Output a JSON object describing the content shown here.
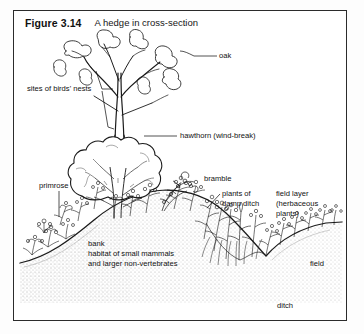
{
  "figure": {
    "number": "Figure 3.14",
    "caption": "A hedge in cross-section"
  },
  "colors": {
    "frame": "#2b2b2b",
    "ink": "#111111",
    "background": "#ffffff",
    "stipple": "#9a9a9a"
  },
  "labels": {
    "oak": "oak",
    "birds_nests": "sites of birds' nests",
    "hawthorn": "hawthorn (wind-break)",
    "primrose": "primrose",
    "bramble": "bramble",
    "damp_ditch_line1": "plants of",
    "damp_ditch_line2": "damp ditch",
    "field_layer_line1": "field layer",
    "field_layer_line2": "(herbaceous",
    "field_layer_line3": "plants)",
    "bank_line1": "bank",
    "bank_line2": "habitat of small mammals",
    "bank_line3": "and larger non-vertebrates",
    "field": "field",
    "ditch": "ditch"
  },
  "diagram": {
    "type": "cross-section illustration",
    "subject": "hedge",
    "elements": [
      "oak tree",
      "hawthorn shrub",
      "bramble",
      "primrose",
      "herbaceous field layer",
      "earth bank",
      "ditch",
      "field"
    ]
  }
}
